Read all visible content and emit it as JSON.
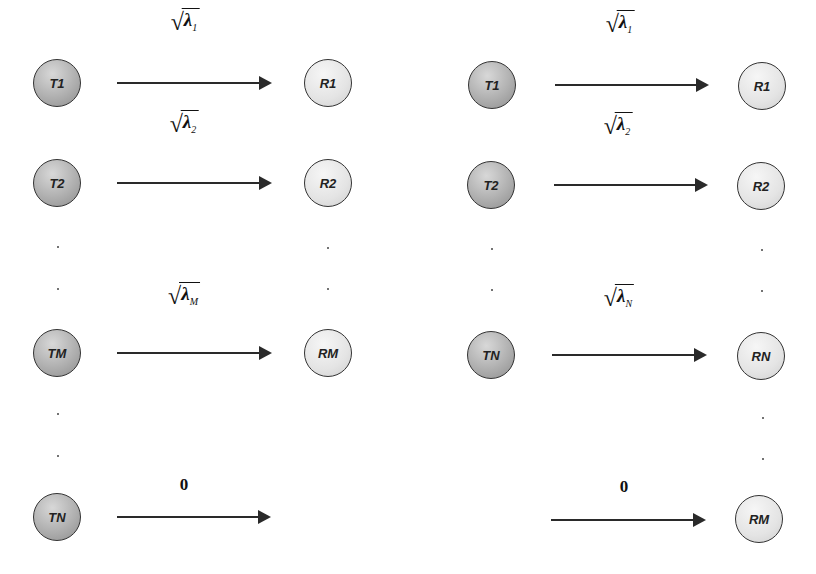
{
  "diagram": {
    "left_panel": {
      "rows": [
        {
          "tx": "T1",
          "rx": "R1",
          "gain_symbol": "λ",
          "gain_sub": "1",
          "y": 83
        },
        {
          "tx": "T2",
          "rx": "R2",
          "gain_symbol": "λ",
          "gain_sub": "2",
          "y": 183
        },
        {
          "tx": "TM",
          "rx": "RM",
          "gain_symbol": "λ",
          "gain_sub": "M",
          "y": 353
        },
        {
          "tx": "TN",
          "rx": null,
          "gain_text": "0",
          "y": 517
        }
      ]
    },
    "right_panel": {
      "rows": [
        {
          "tx": "T1",
          "rx": "R1",
          "gain_symbol": "λ",
          "gain_sub": "1",
          "y": 85
        },
        {
          "tx": "T2",
          "rx": "R2",
          "gain_symbol": "λ",
          "gain_sub": "2",
          "y": 185
        },
        {
          "tx": "TN",
          "rx": "RN",
          "gain_symbol": "λ",
          "gain_sub": "N",
          "y": 355
        },
        {
          "tx": null,
          "rx": "RM",
          "gain_text": "0",
          "y": 520
        }
      ]
    },
    "sqrt_glyph": "√",
    "colors": {
      "tx_fill": "#a8a8a8",
      "rx_fill": "#e6e6e6",
      "stroke": "#2a2a2a"
    }
  }
}
